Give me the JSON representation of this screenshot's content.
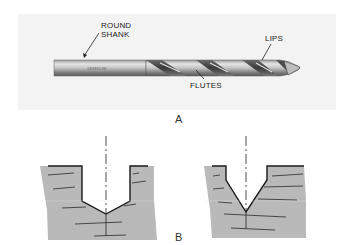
{
  "figure_a": {
    "caption": "A",
    "subject": "twist drill bit",
    "labels": {
      "round_shank_line1": "ROUND",
      "round_shank_line2": "SHANK",
      "lips": "LIPS",
      "flutes": "FLUTES"
    },
    "shank_engraving": "GREENLEE"
  },
  "figure_b": {
    "caption": "B",
    "panels": [
      {
        "name": "flat-bottom-drilled-hole",
        "description": "wide hole with shallow conical bottom"
      },
      {
        "name": "v-bottom-countersink-hole",
        "description": "narrow V-shaped conical hole"
      }
    ]
  },
  "colors": {
    "material_fill": "#b9b9b9",
    "outline": "#1a1a1a",
    "photo_background": "#f3f3f3",
    "drill_steel_dark": "#555555",
    "drill_steel_light": "#d8d8d8"
  }
}
